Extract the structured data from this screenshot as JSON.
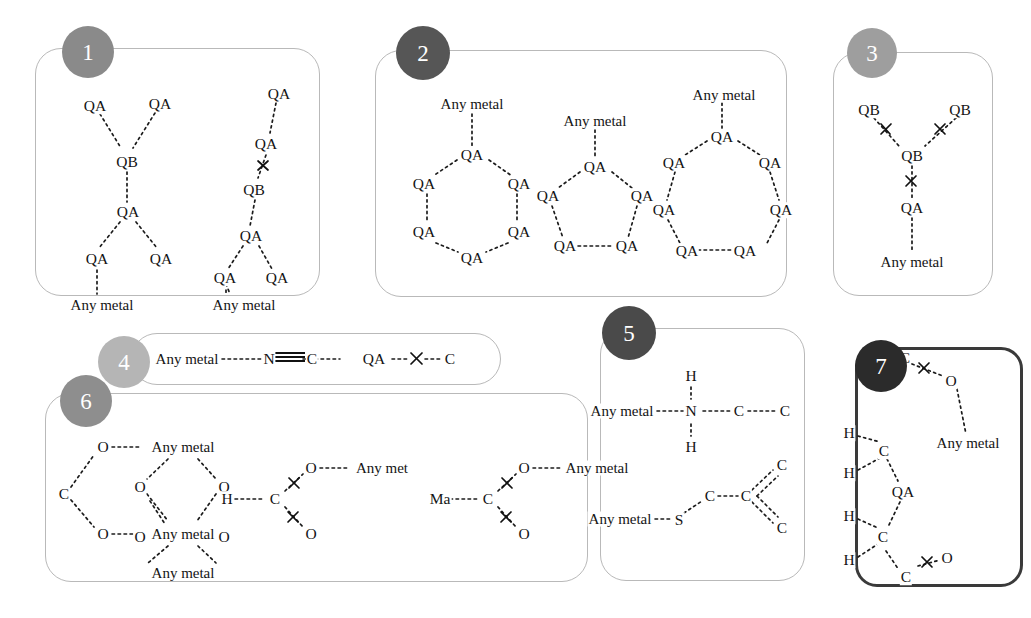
{
  "figure": {
    "type": "chemical-structure-pattern-diagram",
    "background": "#ffffff",
    "panel_border_color": "#b9b9b9",
    "panel_border_color_emphasis": "#3a3a3a"
  },
  "badges": [
    {
      "n": "1",
      "color": "#8a8a8a"
    },
    {
      "n": "2",
      "color": "#565656"
    },
    {
      "n": "3",
      "color": "#9e9e9e"
    },
    {
      "n": "4",
      "color": "#b5b5b5"
    },
    {
      "n": "5",
      "color": "#4a4a4a"
    },
    {
      "n": "6",
      "color": "#8e8e8e"
    },
    {
      "n": "7",
      "color": "#2b2b2b"
    }
  ],
  "labels": {
    "QA": "QA",
    "QB": "QB",
    "any_metal": "Any metal",
    "any_met": "Any met",
    "ma": "Ma",
    "N": "N",
    "C": "C",
    "O": "O",
    "H": "H",
    "S": "S"
  },
  "panels": [
    {
      "id": 1,
      "number": "1",
      "structures": [
        {
          "name": "branched-QB-QA-tree-left",
          "atoms": [
            "QA",
            "QA",
            "QB",
            "QA",
            "QA",
            "QA",
            "Any metal"
          ]
        },
        {
          "name": "linear-QA-QB-QA-tree-right",
          "atoms": [
            "QA",
            "QA",
            "QB",
            "QA",
            "QA",
            "QA",
            "Any metal"
          ],
          "has_cross_bond": true
        }
      ]
    },
    {
      "id": 2,
      "number": "2",
      "structures": [
        {
          "name": "six-membered-QA-ring",
          "ring_size": 6,
          "ring_atom": "QA",
          "substituent": "Any metal"
        },
        {
          "name": "five-membered-QA-ring",
          "ring_size": 5,
          "ring_atom": "QA",
          "substituent": "Any metal"
        },
        {
          "name": "seven-membered-QA-ring",
          "ring_size": 7,
          "ring_atom": "QA",
          "substituent": "Any metal"
        }
      ]
    },
    {
      "id": 3,
      "number": "3",
      "structures": [
        {
          "name": "QB-branch-with-crossed-bonds",
          "atoms": [
            "QB",
            "QB",
            "QB",
            "QA",
            "Any metal"
          ],
          "cross_bond_count": 3
        }
      ]
    },
    {
      "id": 4,
      "number": "4",
      "structures": [
        {
          "name": "nitrile-chain",
          "sequence": [
            "Any metal",
            "N",
            "C",
            "QA",
            "C"
          ],
          "triple_bond_between": [
            "N",
            "C"
          ],
          "cross_bond_between": [
            "QA",
            "C"
          ]
        }
      ]
    },
    {
      "id": 5,
      "number": "5",
      "structures": [
        {
          "name": "amine-metal-complex",
          "atoms": [
            "Any metal",
            "N",
            "H",
            "H",
            "C",
            "C"
          ]
        },
        {
          "name": "thio-alkene-metal-complex",
          "atoms": [
            "Any metal",
            "S",
            "C",
            "C",
            "C",
            "C"
          ],
          "double_bond_count": 2
        }
      ]
    },
    {
      "id": 6,
      "number": "6",
      "structures": [
        {
          "name": "bridging-carboxylate-metal-network",
          "atoms": [
            "O",
            "Any metal",
            "C",
            "O",
            "O",
            "O",
            "Any metal",
            "O",
            "O",
            "Any metal"
          ]
        },
        {
          "name": "formate-metal-left",
          "atoms": [
            "H",
            "C",
            "O",
            "O",
            "Any met"
          ],
          "cross_bond_count": 2
        },
        {
          "name": "formate-metal-right",
          "atoms": [
            "Ma",
            "C",
            "O",
            "O",
            "Any metal"
          ],
          "cross_bond_count": 2
        }
      ]
    },
    {
      "id": 7,
      "number": "7",
      "emphasis": true,
      "structures": [
        {
          "name": "QA-bridged-dicarboxy-metal",
          "atoms": [
            "C",
            "O",
            "Any metal",
            "H",
            "H",
            "C",
            "QA",
            "H",
            "H",
            "C",
            "C",
            "O"
          ],
          "cross_bond_count": 2
        }
      ]
    }
  ]
}
